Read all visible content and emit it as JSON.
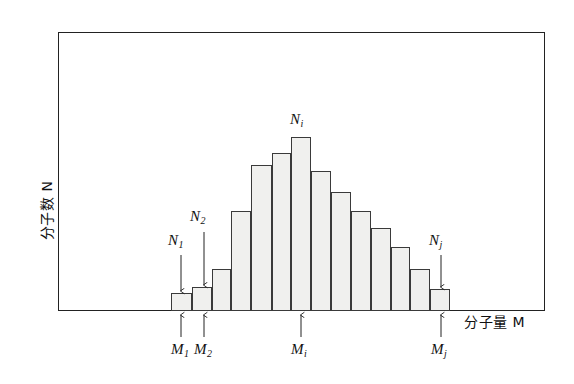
{
  "figure": {
    "axes": {
      "y_label": "分子数 N",
      "x_label": "分子量 M",
      "frame": {
        "x": 58,
        "y": 32,
        "width": 487,
        "height": 279
      }
    },
    "annotations": {
      "n1": "N",
      "n1_sub": "1",
      "n2": "N",
      "n2_sub": "2",
      "ni": "N",
      "ni_sub": "i",
      "nj": "N",
      "nj_sub": "j",
      "m1": "M",
      "m1_sub": "1",
      "m2": "M",
      "m2_sub": "2",
      "mi": "M",
      "mi_sub": "i",
      "mj": "M",
      "mj_sub": "j"
    },
    "colors": {
      "bar_fill": "#f0f0ee",
      "bar_stroke": "#3a3a3a",
      "frame_stroke": "#222222",
      "text": "#111111"
    }
  },
  "chart_data": {
    "type": "bar",
    "title": "",
    "xlabel": "分子量 M",
    "ylabel": "分子数 N",
    "grid": false,
    "legend": null,
    "baseline_y": 311,
    "categories": [
      "M1",
      "M2",
      "M3",
      "M4",
      "M5",
      "M6",
      "Mi",
      "M8",
      "M9",
      "M10",
      "M11",
      "M12",
      "M13",
      "Mj"
    ],
    "values": [
      18,
      24,
      42,
      100,
      146,
      158,
      174,
      140,
      119,
      100,
      83,
      64,
      42,
      22
    ],
    "bar_left_px": [
      171,
      192,
      212,
      231,
      251,
      272,
      291,
      311,
      331,
      351,
      371,
      391,
      410,
      430
    ],
    "bar_right_px": [
      192,
      212,
      231,
      251,
      272,
      291,
      311,
      331,
      351,
      371,
      391,
      410,
      430,
      450
    ],
    "labeled_bars": [
      {
        "index": 0,
        "n_label": "N1",
        "m_label": "M1"
      },
      {
        "index": 1,
        "n_label": "N2",
        "m_label": "M2"
      },
      {
        "index": 6,
        "n_label": "Ni",
        "m_label": "Mi"
      },
      {
        "index": 13,
        "n_label": "Nj",
        "m_label": "Mj"
      }
    ]
  }
}
